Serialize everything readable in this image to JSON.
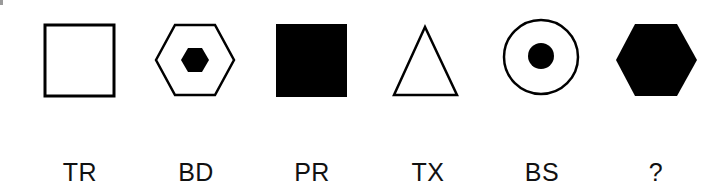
{
  "puzzle": {
    "items": [
      {
        "shape": "outlined-square",
        "description": "Empty square outline",
        "label": "TR"
      },
      {
        "shape": "outlined-hexagon-with-filled-hexagon",
        "description": "Hexagon outline with small filled hexagon inside",
        "label": "BD"
      },
      {
        "shape": "filled-square",
        "description": "Solid black square",
        "label": "PR"
      },
      {
        "shape": "outlined-triangle",
        "description": "Empty triangle outline",
        "label": "TX"
      },
      {
        "shape": "outlined-circle-with-filled-circle",
        "description": "Circle outline with small filled circle inside",
        "label": "BS"
      },
      {
        "shape": "filled-hexagon",
        "description": "Solid black hexagon",
        "label": "?"
      }
    ]
  },
  "colors": {
    "stroke": "#000000",
    "fill": "#000000",
    "background": "#ffffff",
    "text": "#111111"
  }
}
